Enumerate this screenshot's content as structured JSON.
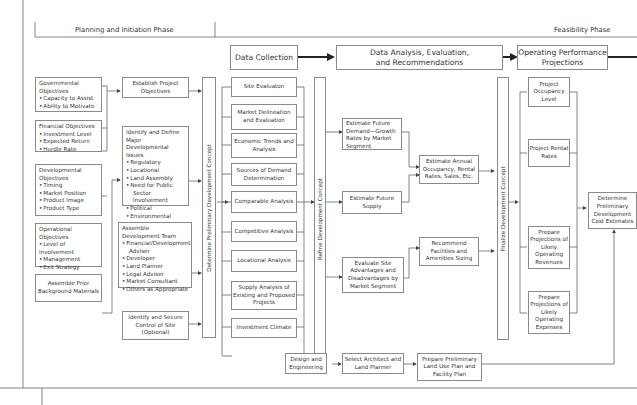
{
  "phases": {
    "planning": "Planning and Initiation Phase",
    "feasibility": "Feasibility Phase"
  },
  "stage_headers": {
    "data_collection": "Data Collection",
    "data_analysis": "Data Analysis, Evaluation, and Recommendations",
    "operating": "Operating Performance Projections"
  },
  "objectives": {
    "governmental": {
      "title": "Governmental Objectives",
      "items": [
        "Capacity to Assist",
        "Ability to Motivate"
      ]
    },
    "financial": {
      "title": "Financial Objectives",
      "items": [
        "Investment Level",
        "Expected Return",
        "Hurdle Rate"
      ]
    },
    "developmental": {
      "title": "Developmental Objectives",
      "items": [
        "Timing",
        "Market Position",
        "Product Image",
        "Product Type"
      ]
    },
    "operational": {
      "title": "Operational Objectives",
      "items": [
        "Level of Involvement",
        "Management",
        "Exit Strategy"
      ]
    },
    "background": "Assemble Prior Background Materials"
  },
  "planning_steps": {
    "establish": "Establish Project Objectives",
    "issues": {
      "title": "Identify and Define Major Developmental Issues",
      "items": [
        "Regulatory",
        "Locational",
        "Land Assembly",
        "Need for Public",
        "Sector Involvement",
        "Political",
        "Environmental"
      ]
    },
    "team": {
      "title": "Assemble Development Team",
      "items": [
        "Financial/Development",
        "Adviser",
        "Developer",
        "Land Planner",
        "Legal Adviser",
        "Market Consultant",
        "Others as Appropriate"
      ]
    },
    "site_control": "Identify and Secure Control of Site (Optional)"
  },
  "concept_bars": {
    "determine": "Determine Preliminary Development Concept",
    "refine": "Refine Development Concept",
    "finalize": "Finalize Development Concept"
  },
  "data_collection_items": [
    "Site Evaluaton",
    "Market Delineation and Evaluation",
    "Economic Trends and Analysis",
    "Sources of Demand Determination",
    "Comparable Analysis",
    "Competitive Analysis",
    "Locational Analysis",
    "Supply Analysis of Existing and Proposed Projects",
    "Investment Climate"
  ],
  "analysis_items": {
    "future_demand": "Estimate Future Demand—Growth Rates by Market Segment",
    "future_supply": "Estimate Future Supply",
    "annual_occupancy": "Estimate Annual Occupancy, Rental Rates, Sales, Etc.",
    "site_advantages": "Evaluate Site Advantages and Disadvantages by Market Segment",
    "facilities": "Recommend Facilities and Amenities Sizing"
  },
  "operating_items": [
    "Project Occupancy Level",
    "Project Rental Rates",
    "Prepare Projections of Likely Operating Revenues",
    "Prepare Projections of Likely Operating Expenses"
  ],
  "cost_estimates": "Determine Preliminary Development Cost Estimates",
  "design_items": [
    "Design and Engineering",
    "Select Architect and Land Planner",
    "Prepare Preliminary Land Use Plan and Facility Plan"
  ]
}
